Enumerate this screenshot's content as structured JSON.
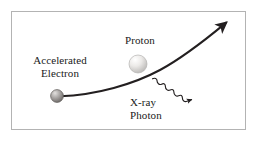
{
  "figure": {
    "background_color": "#ffffff",
    "frame_color": "#b3b3b3",
    "ink_color": "#231f20"
  },
  "labels": {
    "electron": {
      "line1": "Accelerated",
      "line2": "Electron"
    },
    "proton": {
      "line1": "Proton"
    },
    "photon": {
      "line1": "X-ray",
      "line2": "Photon"
    }
  },
  "particles": {
    "electron": {
      "name": "electron-sphere",
      "cx": 57,
      "cy": 96,
      "r": 6.5,
      "fill_light": "#c8c6c4",
      "fill_dark": "#6e6a68"
    },
    "proton": {
      "name": "proton-sphere",
      "cx": 138,
      "cy": 64,
      "r": 9,
      "fill_light": "#ffffff",
      "fill_dark": "#bdbbb9"
    }
  },
  "paths": {
    "trajectory": {
      "name": "electron-trajectory-arrow",
      "start_x": 60,
      "start_y": 96,
      "end_x": 228,
      "end_y": 21,
      "stroke_width": 2,
      "has_arrowhead": true
    },
    "photon_wave": {
      "name": "xray-photon-wave-arrow",
      "start_x": 152,
      "start_y": 79,
      "end_x": 196,
      "end_y": 106,
      "stroke_width": 1.2,
      "has_arrowhead": true
    }
  }
}
